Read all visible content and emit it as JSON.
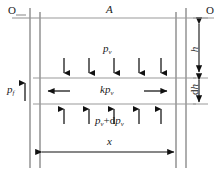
{
  "figure": {
    "kind": "free-body-diagram",
    "width": 224,
    "height": 174
  },
  "labels": {
    "origin_left": "O",
    "origin_right": "O",
    "area": "A",
    "vapor_pressure": {
      "base": "p",
      "sub": "v"
    },
    "lateral_pressure": {
      "prefix": "k",
      "base": "p",
      "sub": "v"
    },
    "bottom_pressure": {
      "base1": "p",
      "sub1": "v",
      "operator": "+",
      "d": "d",
      "base2": "p",
      "sub2": "v"
    },
    "fluid_pressure": {
      "base": "p",
      "sub": "f"
    },
    "depth": "h",
    "element_thickness": {
      "d": "d",
      "base": "h"
    },
    "horizontal_distance": "x"
  },
  "arrows": {
    "top_face_count": 5,
    "top_face_direction": "down",
    "bottom_face_count": 5,
    "bottom_face_direction": "up",
    "lateral_left_direction": "left",
    "lateral_right_direction": "right",
    "fluid_pressure_direction": "up",
    "depth_dimension": "double-headed-vertical",
    "thickness_dimension": "double-headed-vertical",
    "distance_dimension": "double-headed-horizontal"
  },
  "colors": {
    "structure_line": "#9a9a9a",
    "datum_line": "#8f8f8f",
    "arrow": "#111111",
    "text": "#1a1a1a",
    "background": "#ffffff"
  },
  "geometry": {
    "left_outer_x": 30,
    "left_inner_x": 40,
    "right_inner_x": 176,
    "right_outer_x": 186,
    "top_line_y": 18,
    "band_top_y": 78,
    "band_bottom_y": 104,
    "bottom_line_y": 164,
    "dim_x_y": 152,
    "dim_h_x": 199,
    "dim_dh_x": 199
  }
}
